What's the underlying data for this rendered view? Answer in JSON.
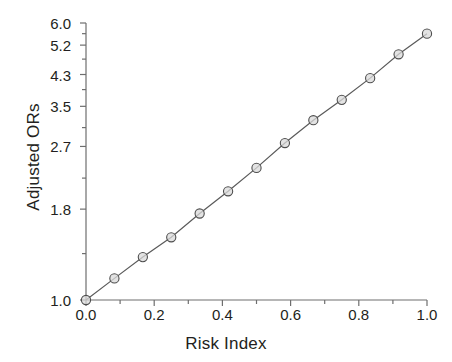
{
  "chart_data": {
    "type": "line",
    "title": "",
    "xlabel": "Risk Index",
    "ylabel": "Adjusted ORs",
    "xlim": [
      0.0,
      1.0
    ],
    "ylim": [
      1.0,
      6.0
    ],
    "yscale": "log",
    "grid": false,
    "legend": null,
    "marker": "open-circle",
    "x_tick_labels": [
      "0.0",
      "0.2",
      "0.4",
      "0.6",
      "0.8",
      "1.0"
    ],
    "x_tick_values": [
      0.0,
      0.2,
      0.4,
      0.6,
      0.8,
      1.0
    ],
    "x_minor_tick_values": [
      0.1,
      0.3,
      0.5,
      0.7,
      0.9
    ],
    "y_tick_labels": [
      "1.0",
      "1.8",
      "2.7",
      "3.5",
      "4.3",
      "5.2",
      "6.0"
    ],
    "y_tick_values": [
      1.0,
      1.8,
      2.7,
      3.5,
      4.3,
      5.2,
      6.0
    ],
    "y_minor_tick_values": [
      1.35,
      2.2,
      3.05,
      3.9,
      4.75,
      5.6
    ],
    "x": [
      0.0,
      0.0833,
      0.1667,
      0.25,
      0.3333,
      0.4167,
      0.5,
      0.5833,
      0.6667,
      0.75,
      0.8333,
      0.9167,
      1.0
    ],
    "values": [
      1.0,
      1.15,
      1.32,
      1.5,
      1.75,
      2.02,
      2.35,
      2.76,
      3.2,
      3.65,
      4.2,
      4.9,
      5.6
    ],
    "series": [
      {
        "name": "Adjusted ORs",
        "values": [
          1.0,
          1.15,
          1.32,
          1.5,
          1.75,
          2.02,
          2.35,
          2.76,
          3.2,
          3.65,
          4.2,
          4.9,
          5.6
        ]
      }
    ],
    "colors": {
      "line": "#5a5a5a",
      "marker_face": "#d9d9d9",
      "marker_edge": "#4d4d4d",
      "axis": "#6e6e6e",
      "text": "#231f20"
    }
  }
}
